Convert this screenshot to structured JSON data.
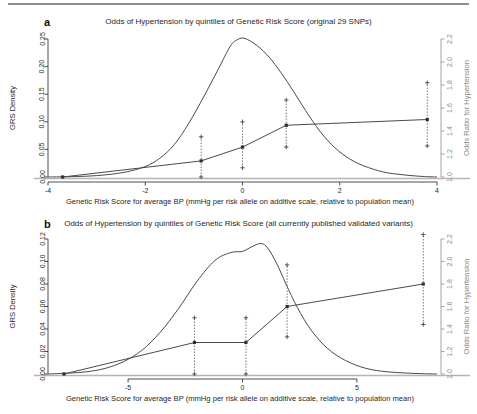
{
  "figure": {
    "panels": [
      {
        "id": "a",
        "letter": "a",
        "title": "Odds of Hypertension by quintiles of Genetic Risk Score (original 29 SNPs)",
        "xlabel": "Genetic Risk Score for average BP (mmHg per risk allele on additive scale, relative to population mean)",
        "ylabel_left": "GRS Density",
        "ylabel_right": "Odds Ratio for Hypertension"
      },
      {
        "id": "b",
        "letter": "b",
        "title": "Odds of Hypertension by quintiles of Genetic Risk Score (all currently published validated variants)",
        "xlabel": "Genetic Risk Score for average BP (mmHg per risk allele on additive scale, relative to population mean)",
        "ylabel_left": "GRS Density",
        "ylabel_right": "Odds Ratio for Hypertension"
      }
    ]
  },
  "chart_data": [
    {
      "type": "line",
      "panel": "a",
      "title": "Odds of Hypertension by quintiles of Genetic Risk Score (original 29 SNPs)",
      "xlabel": "Genetic Risk Score for average BP (mmHg per risk allele on additive scale, relative to population mean)",
      "ylabel": "GRS Density",
      "ylabel_right": "Odds Ratio for Hypertension",
      "xlim": [
        -4,
        4
      ],
      "xticks": [
        -4,
        -2,
        0,
        2,
        4
      ],
      "xticklabels": [
        "-4",
        "-2",
        "0",
        "2",
        "4"
      ],
      "ylim_left": [
        0.0,
        0.25
      ],
      "yticks_left": [
        0.0,
        0.05,
        0.1,
        0.15,
        0.2,
        0.25
      ],
      "yticklabels_left": [
        "0.00",
        "0.05",
        "0.10",
        "0.15",
        "0.20",
        "0.25"
      ],
      "ylim_right": [
        1.0,
        2.2
      ],
      "yticks_right": [
        1.0,
        1.2,
        1.4,
        1.6,
        1.8,
        2.0,
        2.2
      ],
      "yticklabels_right": [
        "1.0",
        "1.2",
        "1.4",
        "1.6",
        "1.8",
        "2.0",
        "2.2"
      ],
      "grid": false,
      "legend": "none",
      "series": [
        {
          "name": "GRS density",
          "type": "density",
          "x": [
            -4.0,
            -3.6,
            -3.2,
            -2.8,
            -2.4,
            -2.0,
            -1.7,
            -1.4,
            -1.1,
            -0.8,
            -0.5,
            -0.25,
            -0.1,
            0.05,
            0.3,
            0.55,
            0.8,
            1.05,
            1.3,
            1.6,
            1.9,
            2.2,
            2.5,
            2.9,
            3.3,
            3.7,
            4.0
          ],
          "y": [
            0.0,
            0.0005,
            0.0015,
            0.004,
            0.009,
            0.019,
            0.034,
            0.059,
            0.098,
            0.145,
            0.195,
            0.237,
            0.249,
            0.251,
            0.238,
            0.217,
            0.188,
            0.155,
            0.12,
            0.082,
            0.053,
            0.033,
            0.02,
            0.009,
            0.004,
            0.001,
            0.0
          ]
        },
        {
          "name": "Odds ratio by quintile",
          "type": "quintile-estimates",
          "quintile_labels": [
            "Q1",
            "Q2",
            "Q3",
            "Q4",
            "Q5"
          ],
          "x": [
            -3.7,
            -0.85,
            0.0,
            0.9,
            3.8
          ],
          "odds_ratio": [
            1.0,
            1.14,
            1.26,
            1.45,
            1.5
          ],
          "ci_low": [
            1.0,
            1.0,
            1.08,
            1.26,
            1.27
          ],
          "ci_high": [
            1.0,
            1.35,
            1.48,
            1.67,
            1.82
          ]
        }
      ]
    },
    {
      "type": "line",
      "panel": "b",
      "title": "Odds of Hypertension by quintiles of Genetic Risk Score (all currently published validated variants)",
      "xlabel": "Genetic Risk Score for average BP (mmHg per risk allele on additive scale, relative to population mean)",
      "ylabel": "GRS Density",
      "ylabel_right": "Odds Ratio for Hypertension",
      "xlim": [
        -8.5,
        8.5
      ],
      "xticks": [
        -5,
        0,
        5
      ],
      "xticklabels": [
        "-5",
        "0",
        "5"
      ],
      "ylim_left": [
        0.0,
        0.12
      ],
      "yticks_left": [
        0.0,
        0.02,
        0.04,
        0.06,
        0.08,
        0.1,
        0.12
      ],
      "yticklabels_left": [
        "0.00",
        "0.02",
        "0.04",
        "0.06",
        "0.08",
        "0.10",
        "0.12"
      ],
      "ylim_right": [
        1.0,
        2.2
      ],
      "yticks_right": [
        1.0,
        1.2,
        1.4,
        1.6,
        1.8,
        2.0,
        2.2
      ],
      "yticklabels_right": [
        "1.0",
        "1.2",
        "1.4",
        "1.6",
        "1.8",
        "2.0",
        "2.2"
      ],
      "grid": false,
      "legend": "none",
      "series": [
        {
          "name": "GRS density",
          "type": "density",
          "x": [
            -8.5,
            -7.6,
            -6.8,
            -6.0,
            -5.2,
            -4.4,
            -3.6,
            -2.8,
            -2.0,
            -1.2,
            -0.5,
            0.0,
            0.4,
            0.8,
            1.1,
            1.5,
            1.9,
            2.4,
            3.0,
            3.7,
            4.5,
            5.4,
            6.3,
            7.2,
            8.0,
            8.5
          ],
          "y": [
            0.0,
            0.0008,
            0.002,
            0.005,
            0.011,
            0.021,
            0.037,
            0.058,
            0.082,
            0.101,
            0.108,
            0.109,
            0.113,
            0.116,
            0.112,
            0.098,
            0.08,
            0.059,
            0.039,
            0.023,
            0.012,
            0.005,
            0.002,
            0.0008,
            0.0002,
            0.0
          ]
        },
        {
          "name": "Odds ratio by quintile",
          "type": "quintile-estimates",
          "quintile_labels": [
            "Q1",
            "Q2",
            "Q3",
            "Q4",
            "Q5"
          ],
          "x": [
            -7.8,
            -2.1,
            0.15,
            1.95,
            7.9
          ],
          "odds_ratio": [
            1.0,
            1.28,
            1.28,
            1.6,
            1.8
          ],
          "ci_low": [
            1.0,
            1.0,
            1.0,
            1.33,
            1.44
          ],
          "ci_high": [
            1.0,
            1.5,
            1.5,
            1.97,
            2.24
          ]
        }
      ]
    }
  ]
}
